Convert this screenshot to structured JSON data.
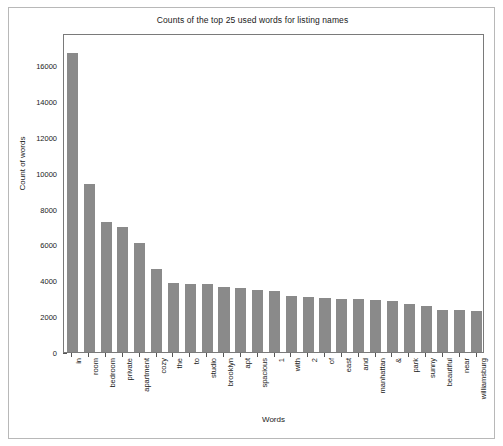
{
  "figure": {
    "title": "Counts of the top 25 used words for listing names",
    "bar_color": "#8a8a8a",
    "frame_color": "#7a7a7a",
    "border_color": "#b8b8b8",
    "background": "#ffffff"
  },
  "chart_data": {
    "type": "bar",
    "title": "Counts of the top 25 used words for listing names",
    "xlabel": "Words",
    "ylabel": "Count of words",
    "ylim": [
      0,
      17800
    ],
    "yticks": [
      0,
      2000,
      4000,
      6000,
      8000,
      10000,
      12000,
      14000,
      16000
    ],
    "ytick_labels": [
      "0",
      "2000",
      "4000",
      "6000",
      "8000",
      "10000",
      "12000",
      "14000",
      "16000"
    ],
    "grid": false,
    "legend": null,
    "categories": [
      "in",
      "room",
      "bedroom",
      "private",
      "apartment",
      "cozy",
      "the",
      "to",
      "studio",
      "brooklyn",
      "apt",
      "spacious",
      "1",
      "with",
      "2",
      "of",
      "east",
      "and",
      "manhattan",
      "&",
      "park",
      "sunny",
      "beautiful",
      "near",
      "williamsburg"
    ],
    "values": [
      16700,
      9350,
      7250,
      7000,
      6100,
      4650,
      3830,
      3790,
      3770,
      3600,
      3580,
      3450,
      3400,
      3130,
      3080,
      3030,
      2980,
      2950,
      2900,
      2870,
      2660,
      2580,
      2350,
      2330,
      2310
    ]
  }
}
